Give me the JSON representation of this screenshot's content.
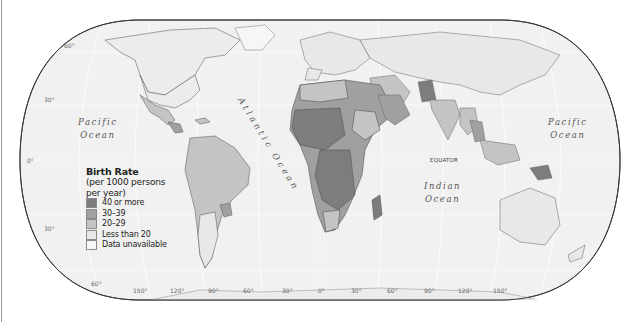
{
  "map": {
    "title": "Birth Rate",
    "projection": "robinson-style rounded world map",
    "background_color": "#ffffff",
    "ocean_color": "#f1f1f1",
    "border_color": "#555555"
  },
  "legend": {
    "title": "Birth Rate",
    "subtitle_line1": "(per 1000 persons",
    "subtitle_line2": "per year)",
    "items": [
      {
        "label": "40 or more",
        "color": "#7d7d7d"
      },
      {
        "label": "30–39",
        "color": "#a0a0a0"
      },
      {
        "label": "20–29",
        "color": "#c4c4c4"
      },
      {
        "label": "Less than 20",
        "color": "#e8e8e8"
      },
      {
        "label": "Data unavailable",
        "color": "#f6f6f6"
      }
    ]
  },
  "oceans": {
    "pacific_west": {
      "line1": "Pacific",
      "line2": "Ocean"
    },
    "pacific_east": {
      "line1": "Pacific",
      "line2": "Ocean"
    },
    "atlantic": "Atlantic Ocean",
    "indian": {
      "line1": "Indian",
      "line2": "Ocean"
    }
  },
  "equator_label": "EQUATOR",
  "latitude_labels": [
    "60°",
    "30°",
    "0°",
    "30°",
    "60°"
  ],
  "longitude_labels": [
    "150°",
    "120°",
    "90°",
    "60°",
    "30°",
    "0°",
    "30°",
    "60°",
    "90°",
    "120°",
    "150°"
  ]
}
